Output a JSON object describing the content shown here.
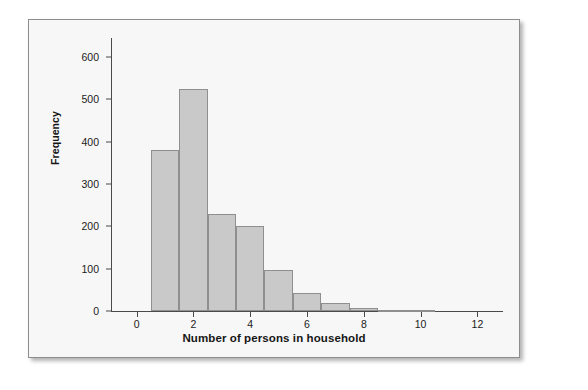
{
  "chart_data": {
    "type": "bar",
    "title": "",
    "xlabel": "Number of persons in household",
    "ylabel": "Frequency",
    "categories": [
      1,
      2,
      3,
      4,
      5,
      6,
      7,
      8,
      9,
      10
    ],
    "values": [
      380,
      525,
      228,
      200,
      97,
      42,
      20,
      6,
      3,
      2
    ],
    "series": [
      {
        "name": "Frequency",
        "values": [
          380,
          525,
          228,
          200,
          97,
          42,
          20,
          6,
          3,
          2
        ]
      }
    ],
    "bar_width": 1,
    "xlim": [
      -0.9,
      12.9
    ],
    "ylim": [
      0,
      645
    ],
    "xticks": [
      0,
      2,
      4,
      6,
      8,
      10,
      12
    ],
    "xtick_labels": [
      "0",
      "2",
      "4",
      "6",
      "8",
      "10",
      "12"
    ],
    "yticks": [
      0,
      100,
      200,
      300,
      400,
      500,
      600
    ],
    "ytick_labels": [
      "0",
      "100",
      "200",
      "300",
      "400",
      "500",
      "600"
    ],
    "grid": false,
    "legend": null,
    "bar_fill_color": "#c9c9c9",
    "bar_edge_color": "#8f8f8f",
    "axis_color": "#4a4a4a",
    "plot_background": "#f7f7f7",
    "panel_border_color": "#8d8d8d"
  }
}
